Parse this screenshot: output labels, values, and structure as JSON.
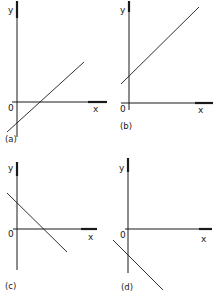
{
  "figure": {
    "ink_color": "#1a1a1a",
    "background": "#ffffff"
  },
  "panels": [
    {
      "id": "a",
      "caption": "(a)",
      "y_label": "y",
      "x_label": "x",
      "origin_label": "0",
      "slope": "positive",
      "y_intercept": "negative"
    },
    {
      "id": "b",
      "caption": "(b)",
      "y_label": "y",
      "x_label": "x",
      "origin_label": "0",
      "slope": "positive",
      "y_intercept": "positive"
    },
    {
      "id": "c",
      "caption": "(c)",
      "y_label": "y",
      "x_label": "x",
      "origin_label": "0",
      "slope": "negative",
      "y_intercept": "positive"
    },
    {
      "id": "d",
      "caption": "(d)",
      "y_label": "y",
      "x_label": "x",
      "origin_label": "0",
      "slope": "negative",
      "y_intercept": "negative"
    }
  ]
}
